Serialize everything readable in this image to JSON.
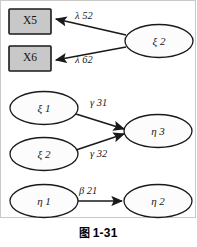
{
  "figure": {
    "caption_symbol": "图",
    "caption_number": "1-31",
    "background_color": "#ffffff",
    "stroke_color": "#1a1a1a",
    "observed_fill_color": "#c8c8c8",
    "latent_fill_color": "#fcfcfc"
  },
  "nodes": {
    "x5": {
      "label": "X5",
      "shape": "rectangle",
      "kind": "observed-variable"
    },
    "x6": {
      "label": "X6",
      "shape": "rectangle",
      "kind": "observed-variable"
    },
    "ksi2_top": {
      "label": "ξ 2",
      "shape": "ellipse",
      "kind": "latent-exogenous"
    },
    "ksi1": {
      "label": "ξ 1",
      "shape": "ellipse",
      "kind": "latent-exogenous"
    },
    "ksi2_mid": {
      "label": "ξ 2",
      "shape": "ellipse",
      "kind": "latent-exogenous"
    },
    "eta3": {
      "label": "η 3",
      "shape": "ellipse",
      "kind": "latent-endogenous"
    },
    "eta1": {
      "label": "η 1",
      "shape": "ellipse",
      "kind": "latent-endogenous"
    },
    "eta2": {
      "label": "η 2",
      "shape": "ellipse",
      "kind": "latent-endogenous"
    }
  },
  "edges": {
    "ksi2_to_x5": {
      "label": "λ 52",
      "from": "ksi2_top",
      "to": "x5"
    },
    "ksi2_to_x6": {
      "label": "λ 62",
      "from": "ksi2_top",
      "to": "x6"
    },
    "ksi1_to_eta3": {
      "label": "γ 31",
      "from": "ksi1",
      "to": "eta3"
    },
    "ksi2_to_eta3": {
      "label": "γ 32",
      "from": "ksi2_mid",
      "to": "eta3"
    },
    "eta1_to_eta2": {
      "label": "β 21",
      "from": "eta1",
      "to": "eta2"
    }
  }
}
